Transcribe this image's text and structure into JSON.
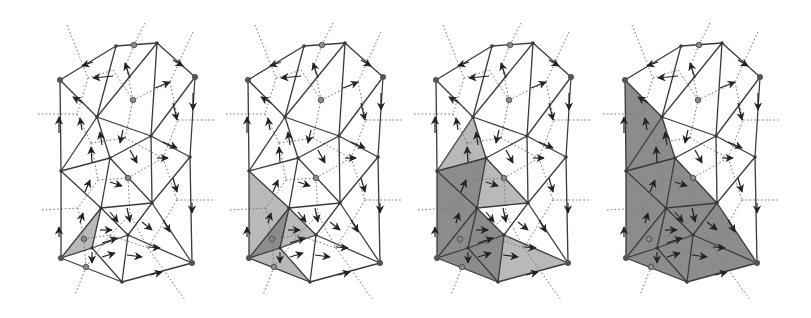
{
  "figure": {
    "panel_count": 4,
    "panel_offsets_x": [
      0,
      188,
      376,
      565
    ],
    "colors": {
      "edge": "#3a3a3a",
      "dual_dashed": "#7a7a7a",
      "arrow": "#222222",
      "fill_light": "#b9b9b9",
      "fill_dark": "#8c8c8c",
      "background": "#ffffff"
    },
    "vertices": {
      "A": [
        60,
        80
      ],
      "B": [
        116,
        46
      ],
      "D": [
        157,
        43
      ],
      "E": [
        195,
        77
      ],
      "F": [
        97,
        117
      ],
      "G": [
        151,
        136
      ],
      "H": [
        190,
        157
      ],
      "I": [
        110,
        158
      ],
      "J": [
        61,
        171
      ],
      "K": [
        101,
        208
      ],
      "L": [
        152,
        203
      ],
      "M": [
        128,
        235
      ],
      "N": [
        61,
        258
      ],
      "O": [
        192,
        263
      ],
      "P": [
        122,
        282
      ],
      "Q": [
        92,
        248
      ]
    },
    "highlight_vertices": [
      "A",
      "E",
      "O",
      "N"
    ],
    "circle_markers": [
      [
        134,
        45
      ],
      [
        133,
        100
      ],
      [
        128,
        178
      ],
      [
        84,
        239
      ],
      [
        86,
        267
      ]
    ],
    "edges": [
      [
        "A",
        "B"
      ],
      [
        "B",
        "D"
      ],
      [
        "D",
        "E"
      ],
      [
        "E",
        "H"
      ],
      [
        "H",
        "O"
      ],
      [
        "A",
        "J"
      ],
      [
        "J",
        "N"
      ],
      [
        "N",
        "P"
      ],
      [
        "P",
        "O"
      ],
      [
        "A",
        "F"
      ],
      [
        "B",
        "F"
      ],
      [
        "D",
        "F"
      ],
      [
        "D",
        "G"
      ],
      [
        "E",
        "G"
      ],
      [
        "F",
        "G"
      ],
      [
        "G",
        "H"
      ],
      [
        "F",
        "I"
      ],
      [
        "I",
        "G"
      ],
      [
        "J",
        "F"
      ],
      [
        "J",
        "I"
      ],
      [
        "I",
        "K"
      ],
      [
        "I",
        "L"
      ],
      [
        "G",
        "L"
      ],
      [
        "H",
        "L"
      ],
      [
        "K",
        "L"
      ],
      [
        "K",
        "M"
      ],
      [
        "L",
        "M"
      ],
      [
        "L",
        "O"
      ],
      [
        "M",
        "O"
      ],
      [
        "M",
        "P"
      ],
      [
        "Q",
        "M"
      ],
      [
        "Q",
        "P"
      ],
      [
        "Q",
        "N"
      ],
      [
        "K",
        "Q"
      ],
      [
        "K",
        "N"
      ],
      [
        "J",
        "K"
      ]
    ],
    "dual_edges": [
      [
        [
          67,
          25
        ],
        [
          88,
          78
        ]
      ],
      [
        [
          88,
          78
        ],
        [
          113,
          70
        ]
      ],
      [
        [
          113,
          70
        ],
        [
          133,
          100
        ]
      ],
      [
        [
          145,
          23
        ],
        [
          134,
          45
        ]
      ],
      [
        [
          134,
          45
        ],
        [
          126,
          65
        ]
      ],
      [
        [
          126,
          65
        ],
        [
          133,
          100
        ]
      ],
      [
        [
          193,
          32
        ],
        [
          170,
          82
        ]
      ],
      [
        [
          133,
          100
        ],
        [
          170,
          82
        ]
      ],
      [
        [
          170,
          82
        ],
        [
          178,
          120
        ]
      ],
      [
        [
          178,
          120
        ],
        [
          215,
          120
        ]
      ],
      [
        [
          88,
          78
        ],
        [
          77,
          114
        ]
      ],
      [
        [
          38,
          114
        ],
        [
          77,
          114
        ]
      ],
      [
        [
          77,
          114
        ],
        [
          91,
          143
        ]
      ],
      [
        [
          91,
          143
        ],
        [
          125,
          138
        ]
      ],
      [
        [
          125,
          138
        ],
        [
          133,
          100
        ]
      ],
      [
        [
          125,
          138
        ],
        [
          163,
          158
        ]
      ],
      [
        [
          163,
          158
        ],
        [
          178,
          120
        ]
      ],
      [
        [
          91,
          143
        ],
        [
          98,
          180
        ]
      ],
      [
        [
          98,
          180
        ],
        [
          128,
          178
        ]
      ],
      [
        [
          128,
          178
        ],
        [
          163,
          158
        ]
      ],
      [
        [
          163,
          158
        ],
        [
          177,
          200
        ]
      ],
      [
        [
          177,
          200
        ],
        [
          215,
          200
        ]
      ],
      [
        [
          98,
          180
        ],
        [
          78,
          208
        ]
      ],
      [
        [
          42,
          210
        ],
        [
          78,
          208
        ]
      ],
      [
        [
          78,
          208
        ],
        [
          84,
          239
        ]
      ],
      [
        [
          128,
          178
        ],
        [
          130,
          215
        ]
      ],
      [
        [
          130,
          215
        ],
        [
          148,
          248
        ]
      ],
      [
        [
          177,
          200
        ],
        [
          148,
          248
        ]
      ],
      [
        [
          148,
          248
        ],
        [
          185,
          300
        ]
      ],
      [
        [
          84,
          239
        ],
        [
          110,
          235
        ]
      ],
      [
        [
          110,
          235
        ],
        [
          130,
          215
        ]
      ],
      [
        [
          110,
          235
        ],
        [
          148,
          248
        ]
      ],
      [
        [
          84,
          239
        ],
        [
          86,
          267
        ]
      ],
      [
        [
          86,
          267
        ],
        [
          75,
          295
        ]
      ],
      [
        [
          86,
          267
        ],
        [
          110,
          235
        ]
      ]
    ],
    "arrows": [
      [
        [
          93,
          62
        ],
        [
          82,
          66
        ]
      ],
      [
        [
          113,
          76
        ],
        [
          93,
          78
        ]
      ],
      [
        [
          130,
          78
        ],
        [
          125,
          63
        ]
      ],
      [
        [
          155,
          88
        ],
        [
          170,
          82
        ]
      ],
      [
        [
          173,
          60
        ],
        [
          183,
          66
        ]
      ],
      [
        [
          193,
          93
        ],
        [
          193,
          110
        ]
      ],
      [
        [
          83,
          103
        ],
        [
          73,
          97
        ]
      ],
      [
        [
          173,
          103
        ],
        [
          177,
          120
        ]
      ],
      [
        [
          59,
          133
        ],
        [
          59,
          117
        ]
      ],
      [
        [
          82,
          130
        ],
        [
          80,
          118
        ]
      ],
      [
        [
          123,
          130
        ],
        [
          120,
          143
        ]
      ],
      [
        [
          102,
          145
        ],
        [
          100,
          132
        ]
      ],
      [
        [
          163,
          142
        ],
        [
          177,
          148
        ]
      ],
      [
        [
          92,
          162
        ],
        [
          91,
          147
        ]
      ],
      [
        [
          130,
          150
        ],
        [
          137,
          163
        ]
      ],
      [
        [
          157,
          158
        ],
        [
          168,
          158
        ]
      ],
      [
        [
          85,
          192
        ],
        [
          90,
          180
        ]
      ],
      [
        [
          110,
          182
        ],
        [
          122,
          186
        ]
      ],
      [
        [
          173,
          178
        ],
        [
          177,
          192
        ]
      ],
      [
        [
          192,
          203
        ],
        [
          192,
          213
        ]
      ],
      [
        [
          80,
          223
        ],
        [
          83,
          213
        ]
      ],
      [
        [
          59,
          237
        ],
        [
          59,
          227
        ]
      ],
      [
        [
          127,
          208
        ],
        [
          130,
          222
        ]
      ],
      [
        [
          110,
          212
        ],
        [
          118,
          222
        ]
      ],
      [
        [
          142,
          222
        ],
        [
          152,
          230
        ]
      ],
      [
        [
          163,
          220
        ],
        [
          170,
          232
        ]
      ],
      [
        [
          100,
          230
        ],
        [
          112,
          230
        ]
      ],
      [
        [
          102,
          243
        ],
        [
          117,
          238
        ]
      ],
      [
        [
          92,
          252
        ],
        [
          92,
          263
        ]
      ],
      [
        [
          102,
          257
        ],
        [
          115,
          253
        ]
      ],
      [
        [
          127,
          255
        ],
        [
          142,
          257
        ]
      ],
      [
        [
          148,
          247
        ],
        [
          160,
          248
        ]
      ],
      [
        [
          150,
          275
        ],
        [
          162,
          272
        ]
      ]
    ],
    "panels": [
      {
        "label": "step-1",
        "shaded": [
          {
            "tri": [
              "N",
              "K",
              "Q"
            ],
            "tone": "light"
          }
        ]
      },
      {
        "label": "step-2",
        "shaded": [
          {
            "tri": [
              "J",
              "K",
              "N"
            ],
            "tone": "light"
          },
          {
            "tri": [
              "K",
              "Q",
              "M"
            ],
            "tone": "light"
          },
          {
            "tri": [
              "N",
              "Q",
              "P"
            ],
            "tone": "light"
          },
          {
            "tri": [
              "N",
              "K",
              "Q"
            ],
            "tone": "dark"
          }
        ]
      },
      {
        "label": "step-3",
        "shaded": [
          {
            "tri": [
              "A",
              "F",
              "J"
            ],
            "tone": "none"
          },
          {
            "tri": [
              "F",
              "I",
              "J"
            ],
            "tone": "light"
          },
          {
            "tri": [
              "I",
              "L",
              "K"
            ],
            "tone": "light"
          },
          {
            "tri": [
              "M",
              "O",
              "P"
            ],
            "tone": "light"
          },
          {
            "tri": [
              "J",
              "I",
              "K"
            ],
            "tone": "dark"
          },
          {
            "tri": [
              "J",
              "K",
              "N"
            ],
            "tone": "dark"
          },
          {
            "tri": [
              "N",
              "K",
              "Q"
            ],
            "tone": "dark"
          },
          {
            "tri": [
              "K",
              "M",
              "Q"
            ],
            "tone": "dark"
          },
          {
            "tri": [
              "Q",
              "M",
              "P"
            ],
            "tone": "dark"
          },
          {
            "tri": [
              "N",
              "Q",
              "P"
            ],
            "tone": "dark"
          }
        ]
      },
      {
        "label": "step-4",
        "shaded": [
          {
            "tri": [
              "A",
              "F",
              "J"
            ],
            "tone": "dark"
          },
          {
            "tri": [
              "F",
              "I",
              "J"
            ],
            "tone": "dark"
          },
          {
            "tri": [
              "J",
              "I",
              "K"
            ],
            "tone": "dark"
          },
          {
            "tri": [
              "I",
              "L",
              "K"
            ],
            "tone": "dark"
          },
          {
            "tri": [
              "J",
              "K",
              "N"
            ],
            "tone": "dark"
          },
          {
            "tri": [
              "N",
              "K",
              "Q"
            ],
            "tone": "dark"
          },
          {
            "tri": [
              "K",
              "M",
              "Q"
            ],
            "tone": "dark"
          },
          {
            "tri": [
              "K",
              "L",
              "M"
            ],
            "tone": "dark"
          },
          {
            "tri": [
              "L",
              "O",
              "M"
            ],
            "tone": "dark"
          },
          {
            "tri": [
              "M",
              "O",
              "P"
            ],
            "tone": "dark"
          },
          {
            "tri": [
              "Q",
              "M",
              "P"
            ],
            "tone": "dark"
          },
          {
            "tri": [
              "N",
              "Q",
              "P"
            ],
            "tone": "dark"
          }
        ]
      }
    ]
  }
}
